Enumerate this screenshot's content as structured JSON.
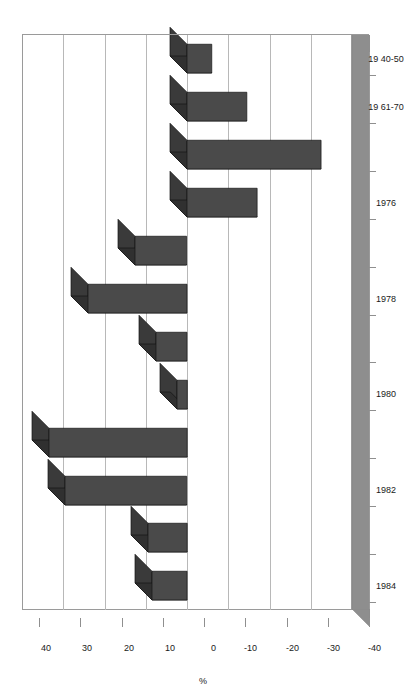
{
  "chart_data": {
    "type": "bar",
    "title": "",
    "subtitle": "",
    "orientation": "horizontal-3d",
    "xlabel": "",
    "ylabel": "%",
    "value_axis_title": "%",
    "categories": [
      "19 40-50",
      "19 61-70",
      "1975",
      "1976",
      "1977",
      "1978",
      "1979",
      "1980",
      "1981",
      "1982",
      "1983",
      "1984"
    ],
    "category_tick_labels": [
      "19 40-50",
      "19 61-70",
      "1976",
      "1978",
      "1980",
      "1982",
      "1984"
    ],
    "values": [
      -6,
      -14.5,
      -32.5,
      -17,
      12.5,
      24,
      7.5,
      2.5,
      33.5,
      29.5,
      9.5,
      8.5
    ],
    "ylim": [
      -40,
      40
    ],
    "tick_labels": [
      "40",
      "30",
      "20",
      "10",
      "0",
      "-10",
      "-20",
      "-30",
      "-40"
    ],
    "tick_values": [
      40,
      30,
      20,
      10,
      0,
      -10,
      -20,
      -30,
      -40
    ],
    "grid": true,
    "legend": false,
    "legend_position": "none",
    "bar_color": "#4a4a4a",
    "bar_top_color": "#3a3a3a",
    "bar_side_color": "#303030",
    "gridline_color": "#b8b8b8",
    "axis_color": "#8f8f8f",
    "background_color": "#ffffff",
    "floor_color": "#8e8e8e"
  },
  "axis": {
    "value_title": "%",
    "value_ticks": [
      "40",
      "30",
      "20",
      "10",
      "0",
      "-10",
      "-20",
      "-30",
      "-40"
    ],
    "category_ticks": [
      "19 40-50",
      "19 61-70",
      "1976",
      "1978",
      "1980",
      "1982",
      "1984"
    ]
  }
}
